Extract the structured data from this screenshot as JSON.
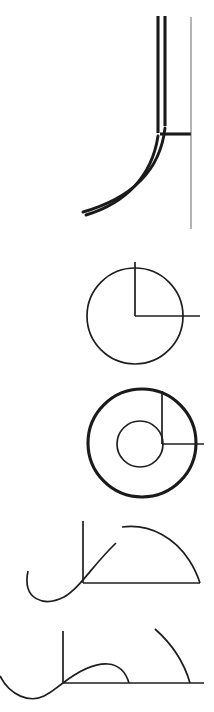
{
  "document": {
    "title": "Geometric Line Figures",
    "kind": "technical-line-drawing",
    "canvas": {
      "width": 214,
      "height": 712
    },
    "background_color": "#ffffff",
    "ink_color": "#1a1a1a",
    "hairline_color": "#5a5a5a",
    "figure_count": 5
  },
  "figures": [
    {
      "id": "figure-1",
      "name": "offset-corner-fillet",
      "label": "Figure 1",
      "description": "Two heavy parallel vertical lines descending to a broad fillet curve sweeping left, a short horizontal tick at the corner, and a tall thin reference line at the right.",
      "bounds": {
        "x": 80,
        "y": 14,
        "width": 115,
        "height": 215
      },
      "elements": [
        {
          "name": "vertical-stem-left",
          "type": "line",
          "weight": "thick",
          "x1": 158,
          "y1": 16,
          "x2": 158,
          "y2": 133
        },
        {
          "name": "vertical-stem-right",
          "type": "line",
          "weight": "thick",
          "x1": 165,
          "y1": 16,
          "x2": 165,
          "y2": 126
        },
        {
          "name": "corner-horizontal-tick",
          "type": "line",
          "weight": "thick",
          "x1": 160,
          "y1": 134,
          "x2": 191,
          "y2": 134
        },
        {
          "name": "reference-line-vertical",
          "type": "line",
          "weight": "hairline",
          "x1": 191,
          "y1": 17,
          "x2": 191,
          "y2": 229
        },
        {
          "name": "fillet-curve-outer",
          "type": "curve",
          "weight": "curve",
          "path": "M 158 136 C 152 176 126 203 86 215"
        },
        {
          "name": "fillet-curve-inner",
          "type": "curve",
          "weight": "curve",
          "path": "M 165 128 C 160 172 131 198 83 212"
        }
      ]
    },
    {
      "id": "figure-2",
      "name": "circle-with-quadrant-axes",
      "label": "Figure 2",
      "description": "A plain circle with a vertical radius rising from the centre past the top edge and a horizontal radius running right past the circumference.",
      "bounds": {
        "x": 86,
        "y": 261,
        "width": 114,
        "height": 104
      },
      "circle": {
        "cx": 135,
        "cy": 316,
        "r": 48
      },
      "elements": [
        {
          "name": "outer-circle",
          "type": "circle",
          "weight": "medium",
          "cx": 135,
          "cy": 316,
          "r": 48
        },
        {
          "name": "vertical-radius",
          "type": "line",
          "weight": "medium",
          "x1": 135,
          "y1": 262,
          "x2": 135,
          "y2": 316
        },
        {
          "name": "horizontal-radius",
          "type": "line",
          "weight": "medium",
          "x1": 135,
          "y1": 316,
          "x2": 200,
          "y2": 316
        }
      ]
    },
    {
      "id": "figure-3",
      "name": "annulus-with-quadrant-axes",
      "label": "Figure 3",
      "description": "A heavy outer circle containing a smaller concentric-style inner circle, with a vertical line dropping from above and a horizontal line extending right, meeting at a point on the inner circle's right edge.",
      "bounds": {
        "x": 85,
        "y": 388,
        "width": 120,
        "height": 110
      },
      "outer_circle": {
        "cx": 142,
        "cy": 443,
        "r": 54
      },
      "inner_circle": {
        "cx": 140,
        "cy": 444,
        "r": 23
      },
      "elements": [
        {
          "name": "annulus-outer-circle",
          "type": "circle",
          "weight": "thick",
          "cx": 142,
          "cy": 443,
          "r": 54
        },
        {
          "name": "annulus-inner-circle",
          "type": "circle",
          "weight": "medium",
          "cx": 140,
          "cy": 444,
          "r": 23
        },
        {
          "name": "vertical-axis-line",
          "type": "line",
          "weight": "medium",
          "x1": 162,
          "y1": 391,
          "x2": 162,
          "y2": 444
        },
        {
          "name": "horizontal-axis-line",
          "type": "line",
          "weight": "medium",
          "x1": 162,
          "y1": 444,
          "x2": 204,
          "y2": 444
        }
      ]
    },
    {
      "id": "figure-4",
      "name": "s-curve-with-dome-arc",
      "label": "Figure 4",
      "description": "An axis cross made of a vertical line and a baseline; an S-shaped curve dips below the baseline to the left then rises steeply through the origin; a separate dome arc springs up and lands on the right end of the baseline.",
      "bounds": {
        "x": 27,
        "y": 521,
        "width": 175,
        "height": 82
      },
      "origin": {
        "x": 83,
        "y": 583
      },
      "elements": [
        {
          "name": "vertical-axis",
          "type": "line",
          "weight": "medium",
          "x1": 83,
          "y1": 521,
          "x2": 83,
          "y2": 583
        },
        {
          "name": "baseline-axis",
          "type": "line",
          "weight": "medium",
          "x1": 83,
          "y1": 583,
          "x2": 200,
          "y2": 583
        },
        {
          "name": "s-curve",
          "type": "curve",
          "weight": "medium",
          "path": "M 28 571 C 22 600 44 607 64 597 C 80 588 92 566 116 543"
        },
        {
          "name": "dome-arc",
          "type": "curve",
          "weight": "medium",
          "path": "M 122 527 C 152 523 176 540 189 560 C 195 569 198 577 200 583"
        }
      ]
    },
    {
      "id": "figure-5",
      "name": "s-curve-bump-with-quarter-arc",
      "label": "Figure 5",
      "description": "An axis cross with a long baseline; an S-curve enters from the left edge, dips, rises through the origin and arches into a low bump that returns to the baseline; a quarter arc falls from upper right onto the baseline near its right end.",
      "bounds": {
        "x": 0,
        "y": 628,
        "width": 205,
        "height": 75
      },
      "origin": {
        "x": 63,
        "y": 683
      },
      "elements": [
        {
          "name": "vertical-axis",
          "type": "line",
          "weight": "medium",
          "x1": 63,
          "y1": 631,
          "x2": 63,
          "y2": 683
        },
        {
          "name": "baseline-axis",
          "type": "line",
          "weight": "medium",
          "x1": 63,
          "y1": 683,
          "x2": 204,
          "y2": 683
        },
        {
          "name": "s-curve-entry",
          "type": "curve",
          "weight": "medium",
          "path": "M 0 676 C 10 696 30 703 44 696 C 54 691 57 687 63 683"
        },
        {
          "name": "bump-curve",
          "type": "curve",
          "weight": "medium",
          "path": "M 63 683 C 80 670 94 663 108 664 C 120 665 126 673 129 683"
        },
        {
          "name": "quarter-arc",
          "type": "curve",
          "weight": "medium",
          "path": "M 155 629 C 172 644 184 662 190 683"
        }
      ]
    }
  ]
}
